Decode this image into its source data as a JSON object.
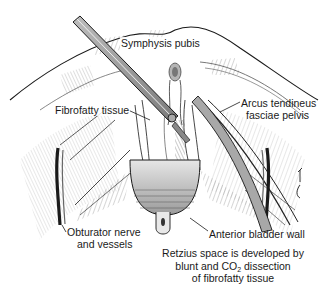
{
  "figure": {
    "labels": {
      "symphysis_pubis": "Symphysis pubis",
      "fibrofatty_tissue": "Fibrofatty tissue",
      "arcus_line1": "Arcus tendineus",
      "arcus_line2": "fasciae pelvis",
      "obturator_line1": "Obturator nerve",
      "obturator_line2": "and vessels",
      "anterior_bladder_wall": "Anterior bladder wall"
    },
    "caption": {
      "line1": "Retzius space is developed by",
      "line2_pre": "blunt and CO",
      "line2_sub": "2",
      "line2_post": " dissection",
      "line3": "of fibrofatty tissue"
    },
    "signature": "C.Wood",
    "colors": {
      "ink": "#1a1a1a",
      "shade": "#8a8a8a",
      "light_shade": "#cfcfcf",
      "background": "#ffffff"
    }
  }
}
